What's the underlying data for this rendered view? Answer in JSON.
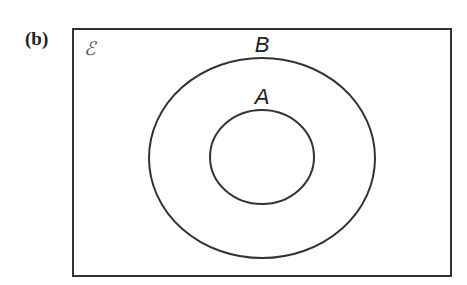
{
  "figure": {
    "part_label": "(b)",
    "universal_set_symbol": "ℰ",
    "sets": [
      {
        "name": "B",
        "role": "outer",
        "contains": [
          "A"
        ]
      },
      {
        "name": "A",
        "role": "inner",
        "subset_of": "B"
      }
    ],
    "colors": {
      "stroke": "#333333",
      "background": "#ffffff"
    }
  }
}
